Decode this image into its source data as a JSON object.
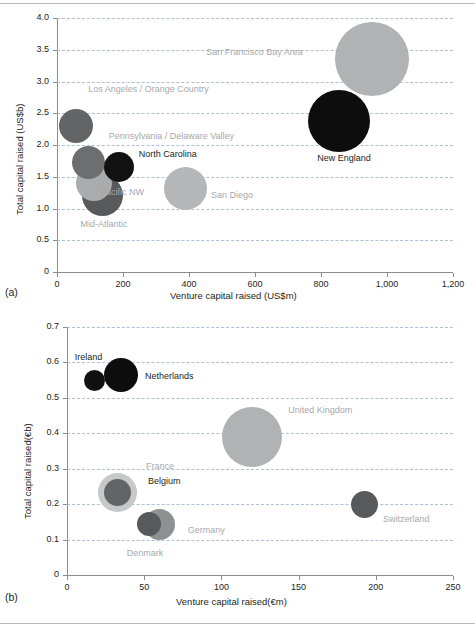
{
  "figure": {
    "panel_a_tag": "(a)",
    "panel_b_tag": "(b)"
  },
  "chart_data": [
    {
      "type": "scatter",
      "bubble": true,
      "panel": "(a)",
      "title": "",
      "xlabel": "Venture capital raised (US$m)",
      "ylabel": "Total capital raised (US$b)",
      "xlim": [
        0,
        1200
      ],
      "ylim": [
        0,
        4.0
      ],
      "xticks": [
        0,
        200,
        400,
        600,
        800,
        1000,
        1200
      ],
      "xticklabels": [
        "0",
        "200",
        "400",
        "600",
        "800",
        "1,000",
        "1,200"
      ],
      "yticks": [
        0,
        0.5,
        1.0,
        1.5,
        2.0,
        2.5,
        3.0,
        3.5,
        4.0
      ],
      "yticklabels": [
        "0",
        "0.5",
        "1.0",
        "1.5",
        "2.0",
        "2.5",
        "3.0",
        "3.5",
        "4.0"
      ],
      "grid": "horizontal-dashed",
      "legend": "none",
      "points": [
        {
          "label": "San Francisco Bay Area",
          "x": 955,
          "y": 3.35,
          "size": 74,
          "color": "#b0b2b4",
          "label_color": "grey",
          "label_dx": -166,
          "label_dy": -6
        },
        {
          "label": "New England",
          "x": 855,
          "y": 2.38,
          "size": 62,
          "color": "#0d0d0d",
          "label_color": "dark",
          "label_dx": -22,
          "label_dy": 38
        },
        {
          "label": "Los Angeles / Orange Country",
          "x": 58,
          "y": 2.3,
          "size": 34,
          "color": "#636466",
          "label_color": "grey",
          "label_dx": 12,
          "label_dy": -36
        },
        {
          "label": "Pennsylvania / Delaware Valley",
          "x": 96,
          "y": 1.72,
          "size": 33,
          "color": "#6d6e70",
          "label_color": "grey",
          "label_dx": 20,
          "label_dy": -26
        },
        {
          "label": "North Carolina",
          "x": 187,
          "y": 1.66,
          "size": 30,
          "color": "#121212",
          "label_color": "dark",
          "label_dx": 20,
          "label_dy": -12
        },
        {
          "label": "Pacific NW",
          "x": 112,
          "y": 1.4,
          "size": 36,
          "color": "#a9abad",
          "label_color": "grey",
          "label_dx": 6,
          "label_dy": 10
        },
        {
          "label": "Mid-Atlantic",
          "x": 138,
          "y": 1.21,
          "size": 41,
          "color": "#58595b",
          "label_color": "grey",
          "label_dx": -22,
          "label_dy": 30
        },
        {
          "label": "San Diego",
          "x": 388,
          "y": 1.32,
          "size": 43,
          "color": "#b4b6b8",
          "label_color": "grey",
          "label_dx": 26,
          "label_dy": 8
        }
      ]
    },
    {
      "type": "scatter",
      "bubble": true,
      "panel": "(b)",
      "title": "",
      "xlabel": "Venture capital raised(€m)",
      "ylabel": "Total capital raised(€b)",
      "xlim": [
        0,
        250
      ],
      "ylim": [
        0,
        0.7
      ],
      "xticks": [
        0,
        50,
        100,
        150,
        200,
        250
      ],
      "xticklabels": [
        "0",
        "50",
        "100",
        "150",
        "200",
        "250"
      ],
      "yticks": [
        0,
        0.1,
        0.2,
        0.3,
        0.4,
        0.5,
        0.6,
        0.7
      ],
      "yticklabels": [
        "0",
        "0.1",
        "0.2",
        "0.3",
        "0.4",
        "0.5",
        "0.6",
        "0.7"
      ],
      "grid": "horizontal-dashed",
      "legend": "none",
      "points": [
        {
          "label": "Ireland",
          "x": 18,
          "y": 0.55,
          "size": 21,
          "color": "#111111",
          "label_color": "dark",
          "label_dx": -20,
          "label_dy": -22
        },
        {
          "label": "Netherlands",
          "x": 35,
          "y": 0.565,
          "size": 34,
          "color": "#0d0d0d",
          "label_color": "dark",
          "label_dx": 24,
          "label_dy": 2
        },
        {
          "label": "United Kingdom",
          "x": 120,
          "y": 0.39,
          "size": 60,
          "color": "#b0b2b4",
          "label_color": "grey",
          "label_dx": 36,
          "label_dy": -26
        },
        {
          "label": "France",
          "x": 33,
          "y": 0.232,
          "size": 39,
          "color": "#c6c8ca",
          "label_color": "grey",
          "label_dx": 28,
          "label_dy": -26
        },
        {
          "label": "Belgium",
          "x": 33,
          "y": 0.233,
          "size": 27,
          "color": "#636466",
          "label_color": "dark",
          "label_dx": 30,
          "label_dy": -10
        },
        {
          "label": "Germany",
          "x": 60,
          "y": 0.142,
          "size": 31,
          "color": "#8e9092",
          "label_color": "grey",
          "label_dx": 28,
          "label_dy": 6
        },
        {
          "label": "Denmark",
          "x": 53,
          "y": 0.145,
          "size": 24,
          "color": "#58595b",
          "label_color": "grey",
          "label_dx": -22,
          "label_dy": 30
        },
        {
          "label": "Switzerland",
          "x": 193,
          "y": 0.2,
          "size": 27,
          "color": "#58595b",
          "label_color": "grey",
          "label_dx": 18,
          "label_dy": 16
        }
      ]
    }
  ]
}
